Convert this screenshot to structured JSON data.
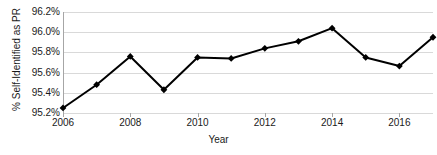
{
  "chart_data": {
    "type": "line",
    "title": "",
    "xlabel": "Year",
    "ylabel": "% Self-Identified as PR",
    "x": [
      2006,
      2007,
      2008,
      2009,
      2010,
      2011,
      2012,
      2013,
      2014,
      2015,
      2016,
      2017
    ],
    "values": [
      95.25,
      95.48,
      95.76,
      95.43,
      95.75,
      95.74,
      95.84,
      95.91,
      96.04,
      95.75,
      95.665,
      95.95
    ],
    "series": [
      {
        "name": "% Self-Identified as PR",
        "values": [
          95.25,
          95.48,
          95.76,
          95.43,
          95.75,
          95.74,
          95.84,
          95.91,
          96.04,
          95.75,
          95.665,
          95.95
        ]
      }
    ],
    "ylim": [
      95.2,
      96.2
    ],
    "xlim": [
      2006,
      2017
    ],
    "y_ticks": [
      95.2,
      95.4,
      95.6,
      95.8,
      96.0,
      96.2
    ],
    "y_tick_labels": [
      "95.2%",
      "95.4%",
      "95.6%",
      "95.8%",
      "96.0%",
      "96.2%"
    ],
    "x_ticks": [
      2006,
      2008,
      2010,
      2012,
      2014,
      2016
    ],
    "x_tick_labels": [
      "2006",
      "2008",
      "2010",
      "2012",
      "2014",
      "2016"
    ],
    "grid": "horizontal",
    "legend": "none",
    "line_color": "#000000",
    "marker": "diamond",
    "marker_color": "#000000"
  },
  "axes": {
    "y_title": "% Self-Identified as PR",
    "x_title": "Year"
  }
}
